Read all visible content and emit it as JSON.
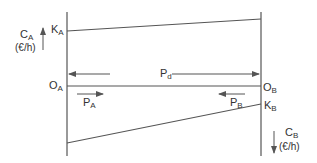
{
  "diagram": {
    "type": "cost-vs-distance",
    "labels": {
      "ca_main": "C",
      "ca_sub": "A",
      "ca_unit": "(€/h)",
      "cb_main": "C",
      "cb_sub": "B",
      "cb_unit": "(€/h)",
      "ka_main": "K",
      "ka_sub": "A",
      "kb_main": "K",
      "kb_sub": "B",
      "oa_main": "O",
      "oa_sub": "A",
      "ob_main": "O",
      "ob_sub": "B",
      "pd_main": "P",
      "pd_sub": "d",
      "pa_main": "P",
      "pa_sub": "A",
      "pb_main": "P",
      "pb_sub": "B"
    },
    "colors": {
      "line": "#555555",
      "text": "#333333"
    }
  }
}
